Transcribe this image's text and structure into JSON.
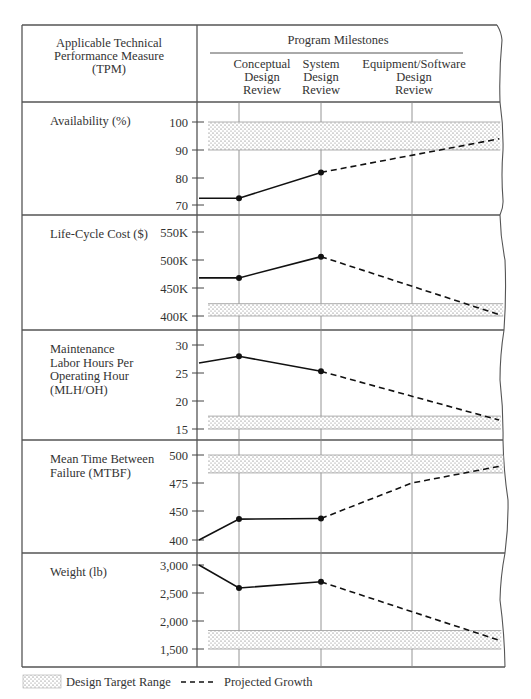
{
  "chart_data": {
    "type": "line",
    "title": "",
    "header": {
      "left_label": [
        "Applicable Technical",
        "Performance Measure",
        "(TPM)"
      ],
      "right_label": "Program Milestones",
      "milestones": [
        {
          "label": [
            "Conceptual",
            "Design",
            "Review"
          ],
          "x_px": 239
        },
        {
          "label": [
            "System",
            "Design",
            "Review"
          ],
          "x_px": 321
        },
        {
          "label": [
            "Equipment/Software",
            "Design",
            "Review"
          ],
          "x_px": 412
        }
      ]
    },
    "legend": {
      "design_target_range": "Design Target Range",
      "projected_growth": "Projected Growth"
    },
    "x_categories": [
      "Start",
      "Conceptual Design Review",
      "System Design Review",
      "Equipment/Software Design Review",
      "End"
    ],
    "panels": [
      {
        "name": "Availability (%)",
        "label_lines": [
          "Availability (%)"
        ],
        "top": 102,
        "bottom": 215,
        "ticks": [
          {
            "label": "100",
            "value": 100,
            "y": 122
          },
          {
            "label": "90",
            "value": 90,
            "y": 150
          },
          {
            "label": "80",
            "value": 80,
            "y": 178
          },
          {
            "label": "70",
            "value": 70,
            "y": 205
          }
        ],
        "target_range": [
          90,
          100
        ],
        "actual": [
          {
            "x": "Start",
            "value": 72.5
          },
          {
            "x": "Conceptual Design Review",
            "value": 72.5
          },
          {
            "x": "System Design Review",
            "value": 82
          }
        ],
        "projected": [
          {
            "x": "System Design Review",
            "value": 82
          },
          {
            "x": "End",
            "value": 94
          }
        ]
      },
      {
        "name": "Life-Cycle Cost ($)",
        "label_lines": [
          "Life-Cycle Cost ($)"
        ],
        "top": 215,
        "bottom": 330,
        "ticks": [
          {
            "label": "550K",
            "value": 550,
            "y": 232
          },
          {
            "label": "500K",
            "value": 500,
            "y": 260
          },
          {
            "label": "450K",
            "value": 450,
            "y": 288
          },
          {
            "label": "400K",
            "value": 400,
            "y": 316
          }
        ],
        "target_range": [
          400,
          422
        ],
        "actual": [
          {
            "x": "Start",
            "value": 468
          },
          {
            "x": "Conceptual Design Review",
            "value": 468
          },
          {
            "x": "System Design Review",
            "value": 506
          }
        ],
        "projected": [
          {
            "x": "System Design Review",
            "value": 506
          },
          {
            "x": "End",
            "value": 402
          }
        ]
      },
      {
        "name": "Maintenance Labor Hours Per Operating Hour (MLH/OH)",
        "label_lines": [
          "Maintenance",
          "Labor Hours Per",
          "Operating Hour",
          "(MLH/OH)"
        ],
        "top": 330,
        "bottom": 440,
        "ticks": [
          {
            "label": "30",
            "value": 30,
            "y": 345
          },
          {
            "label": "25",
            "value": 25,
            "y": 373
          },
          {
            "label": "20",
            "value": 20,
            "y": 401
          },
          {
            "label": "15",
            "value": 15,
            "y": 429
          }
        ],
        "target_range": [
          15,
          17.3
        ],
        "actual": [
          {
            "x": "Start",
            "value": 26.8
          },
          {
            "x": "Conceptual Design Review",
            "value": 28
          },
          {
            "x": "System Design Review",
            "value": 25.3
          }
        ],
        "projected": [
          {
            "x": "System Design Review",
            "value": 25.3
          },
          {
            "x": "End",
            "value": 16.6
          }
        ]
      },
      {
        "name": "Mean Time Between Failure (MTBF)",
        "label_lines": [
          "Mean Time Between",
          "Failure (MTBF)"
        ],
        "top": 440,
        "bottom": 553,
        "ticks": [
          {
            "label": "500",
            "value": 500,
            "y": 455
          },
          {
            "label": "475",
            "value": 475,
            "y": 483
          },
          {
            "label": "450",
            "value": 450,
            "y": 511
          },
          {
            "label": "400",
            "value": 400,
            "y": 540
          }
        ],
        "target_range": [
          484,
          500
        ],
        "actual": [
          {
            "x": "Start",
            "value": 400
          },
          {
            "x": "Conceptual Design Review",
            "value": 436
          },
          {
            "x": "System Design Review",
            "value": 437
          }
        ],
        "projected": [
          {
            "x": "System Design Review",
            "value": 437
          },
          {
            "x": "Equipment/Software Design Review",
            "value": 475
          },
          {
            "x": "End",
            "value": 490
          }
        ]
      },
      {
        "name": "Weight (lb)",
        "label_lines": [
          "Weight (lb)"
        ],
        "top": 553,
        "bottom": 667,
        "ticks": [
          {
            "label": "3,000",
            "value": 3000,
            "y": 565
          },
          {
            "label": "2,500",
            "value": 2500,
            "y": 593
          },
          {
            "label": "2,000",
            "value": 2000,
            "y": 621
          },
          {
            "label": "1,500",
            "value": 1500,
            "y": 649
          }
        ],
        "target_range": [
          1500,
          1830
        ],
        "actual": [
          {
            "x": "Start",
            "value": 3000
          },
          {
            "x": "Conceptual Design Review",
            "value": 2590
          },
          {
            "x": "System Design Review",
            "value": 2700
          }
        ],
        "projected": [
          {
            "x": "System Design Review",
            "value": 2700
          },
          {
            "x": "End",
            "value": 1650
          }
        ]
      }
    ],
    "xlabel": "Program Milestones",
    "ylabel": "Applicable Technical Performance Measure (TPM)",
    "grid": true,
    "legend_position": "bottom-left"
  }
}
